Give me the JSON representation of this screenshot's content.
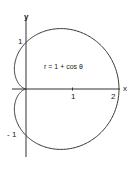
{
  "chart_data": {
    "type": "line",
    "title": "",
    "equation": "r = 1 + cos θ",
    "curve": "cardioid",
    "xlabel": "x",
    "ylabel": "y",
    "x_ticks": [
      {
        "value": 1,
        "label": "1"
      },
      {
        "value": 2,
        "label": "2"
      }
    ],
    "y_ticks": [
      {
        "value": 1,
        "label": "1"
      },
      {
        "value": -1,
        "label": "- 1"
      }
    ],
    "xlim": [
      -0.3,
      2.0
    ],
    "ylim": [
      -1.5,
      1.5
    ],
    "grid": false,
    "color": "#333333"
  }
}
